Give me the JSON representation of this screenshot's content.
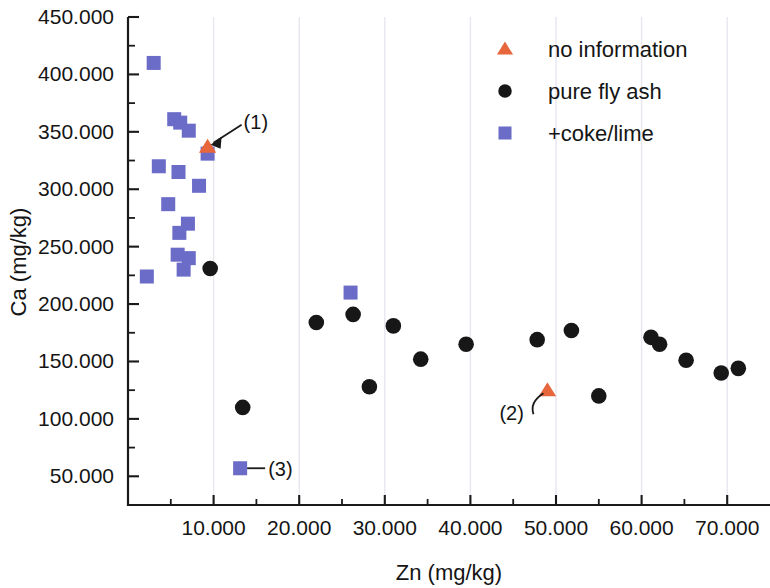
{
  "chart_data": {
    "type": "scatter",
    "title": "",
    "xlabel": "Zn (mg/kg)",
    "ylabel": "Ca (mg/kg)",
    "xlim": [
      0,
      75000
    ],
    "ylim": [
      25000,
      450000
    ],
    "xticks": [
      10000,
      20000,
      30000,
      40000,
      50000,
      60000,
      70000
    ],
    "xtick_labels": [
      "10.000",
      "20.000",
      "30.000",
      "40.000",
      "50.000",
      "60.000",
      "70.000"
    ],
    "yticks": [
      50000,
      100000,
      150000,
      200000,
      250000,
      300000,
      350000,
      400000,
      450000
    ],
    "ytick_labels": [
      "50.000",
      "100.000",
      "150.000",
      "200.000",
      "250.000",
      "300.000",
      "350.000",
      "400.000",
      "450.000"
    ],
    "grid": "faint vertical gridlines at major x ticks",
    "legend_position": "top-right inside axes",
    "colors": {
      "no_information": "#E8663C",
      "pure_fly_ash": "#171717",
      "coke_lime": "#6B6BC8"
    },
    "series": [
      {
        "name": "no information",
        "marker": "triangle",
        "color": "#E8663C",
        "points": [
          {
            "x": 9300,
            "y": 337000
          },
          {
            "x": 49000,
            "y": 125000
          }
        ]
      },
      {
        "name": "pure fly ash",
        "marker": "circle",
        "color": "#171717",
        "points": [
          {
            "x": 9600,
            "y": 231000
          },
          {
            "x": 13400,
            "y": 110000
          },
          {
            "x": 22000,
            "y": 184000
          },
          {
            "x": 26300,
            "y": 191000
          },
          {
            "x": 28200,
            "y": 128000
          },
          {
            "x": 31000,
            "y": 181000
          },
          {
            "x": 34200,
            "y": 152000
          },
          {
            "x": 39500,
            "y": 165000
          },
          {
            "x": 47800,
            "y": 169000
          },
          {
            "x": 51800,
            "y": 177000
          },
          {
            "x": 55000,
            "y": 120000
          },
          {
            "x": 61100,
            "y": 171000
          },
          {
            "x": 62100,
            "y": 165000
          },
          {
            "x": 65200,
            "y": 151000
          },
          {
            "x": 69300,
            "y": 140000
          },
          {
            "x": 71300,
            "y": 144000
          }
        ]
      },
      {
        "name": "+coke/lime",
        "marker": "square",
        "color": "#6B6BC8",
        "points": [
          {
            "x": 3000,
            "y": 410000
          },
          {
            "x": 5400,
            "y": 361000
          },
          {
            "x": 6100,
            "y": 358000
          },
          {
            "x": 7100,
            "y": 351000
          },
          {
            "x": 9300,
            "y": 331000
          },
          {
            "x": 3600,
            "y": 320000
          },
          {
            "x": 5900,
            "y": 315000
          },
          {
            "x": 8300,
            "y": 303000
          },
          {
            "x": 4700,
            "y": 287000
          },
          {
            "x": 7000,
            "y": 270000
          },
          {
            "x": 6000,
            "y": 262000
          },
          {
            "x": 5800,
            "y": 243000
          },
          {
            "x": 7100,
            "y": 240000
          },
          {
            "x": 6500,
            "y": 230000
          },
          {
            "x": 2200,
            "y": 224000
          },
          {
            "x": 26000,
            "y": 210000
          },
          {
            "x": 13100,
            "y": 57000
          }
        ]
      }
    ],
    "annotations": [
      {
        "label": "(1)",
        "x": 9300,
        "y": 337000,
        "marker": "triangle",
        "label_dx": 26,
        "label_dy": -26
      },
      {
        "label": "(2)",
        "x": 49000,
        "y": 125000,
        "marker": "triangle",
        "label_dx": -42,
        "label_dy": 22
      },
      {
        "label": "(3)",
        "x": 13100,
        "y": 57000,
        "marker": "square",
        "label_dx": 28,
        "label_dy": 0
      }
    ]
  },
  "legend": {
    "items": [
      {
        "label": "no information",
        "marker": "triangle",
        "color": "#E8663C"
      },
      {
        "label": "pure fly ash",
        "marker": "circle",
        "color": "#171717"
      },
      {
        "label": "+coke/lime",
        "marker": "square",
        "color": "#6B6BC8"
      }
    ]
  },
  "axes": {
    "x_title": "Zn (mg/kg)",
    "y_title": "Ca (mg/kg)"
  }
}
